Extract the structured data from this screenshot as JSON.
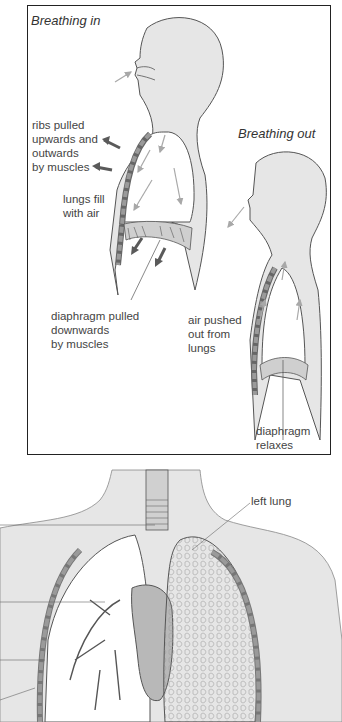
{
  "panel_top": {
    "breathing_in": {
      "title": "Breathing in",
      "labels": {
        "ribs": "ribs pulled\nupwards and\noutwards\nby muscles",
        "lungs_fill": "lungs fill\nwith air",
        "diaphragm": "diaphragm pulled\ndownwards\nby muscles"
      }
    },
    "breathing_out": {
      "title": "Breathing out",
      "labels": {
        "air_pushed": "air pushed\nout from\nlungs",
        "diaphragm": "diaphragm\nrelaxes"
      }
    }
  },
  "panel_bottom": {
    "labels": {
      "left_lung": "left lung"
    }
  },
  "colors": {
    "body_fill": "#e6e6e6",
    "outline": "#555555",
    "rib_fill": "#9a9a9a",
    "arrow_dark": "#5a5a5a",
    "arrow_light": "#a8a8a8",
    "heart_fill": "#b8b8b8",
    "border": "#222222"
  }
}
